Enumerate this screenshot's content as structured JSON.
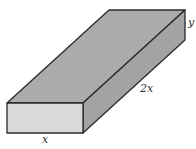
{
  "diagram": {
    "type": "rectangular-box",
    "labels": {
      "width": "x",
      "length": "2x",
      "height": "y"
    },
    "colors": {
      "top_face": "#ababab",
      "front_face": "#d9d9d9",
      "side_face": "#a3a3a3",
      "edge": "#2a2a2a",
      "background": "#ffffff"
    }
  }
}
